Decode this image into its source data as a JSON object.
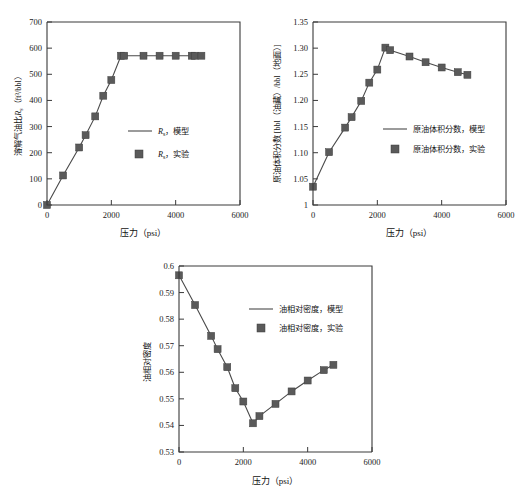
{
  "figure": {
    "background_color": "#ffffff",
    "line_color": "#4a4a4a",
    "marker_color": "#5a5a5a",
    "axis_color": "#3a3a3a"
  },
  "panels": [
    {
      "id": "rs",
      "name": "solution-gas-oil-ratio-chart"
    },
    {
      "id": "bo",
      "name": "oil-formation-volume-factor-chart"
    },
    {
      "id": "dens",
      "name": "oil-relative-density-chart"
    }
  ],
  "chart_data": [
    {
      "type": "line",
      "id": "rs",
      "title": "",
      "xlabel": "压力（psi）",
      "ylabel": "溶解气油比Rs（ft³/bbl）",
      "ylabel_main": "溶解气油比",
      "ylabel_symbol": "R",
      "ylabel_symbol_sub": "s",
      "ylabel_units": "（ft³/bbl）",
      "xlim": [
        0,
        6000
      ],
      "ylim": [
        0,
        700
      ],
      "xticks": [
        0,
        2000,
        4000,
        6000
      ],
      "xticklabels": [
        "0",
        "2000",
        "4000",
        "6000"
      ],
      "yticks": [
        0,
        100,
        200,
        300,
        400,
        500,
        600,
        700
      ],
      "yticklabels": [
        "0",
        "100",
        "200",
        "300",
        "400",
        "500",
        "600",
        "700"
      ],
      "grid": false,
      "legend_position": "center-right",
      "legend": [
        {
          "label": "Rs，模型",
          "label_prefix": "R",
          "label_sub": "s",
          "label_suffix": "，模型",
          "type": "line"
        },
        {
          "label": "Rs，实验",
          "label_prefix": "R",
          "label_sub": "s",
          "label_suffix": "，实验",
          "type": "marker"
        }
      ],
      "series": [
        {
          "name": "Rs，模型",
          "kind": "line",
          "x": [
            0,
            500,
            1000,
            1200,
            1500,
            1750,
            2000,
            2300,
            2400,
            3000,
            3500,
            4000,
            4500,
            4600,
            4800
          ],
          "y": [
            0,
            113,
            220,
            267,
            339,
            418,
            478,
            571,
            571,
            571,
            571,
            571,
            571,
            571,
            571
          ]
        },
        {
          "name": "Rs，实验",
          "kind": "marker",
          "x": [
            0,
            500,
            1000,
            1200,
            1500,
            1750,
            2000,
            2300,
            2400,
            3000,
            3500,
            4000,
            4500,
            4600,
            4800
          ],
          "y": [
            0,
            113,
            220,
            267,
            339,
            418,
            478,
            571,
            571,
            571,
            571,
            571,
            571,
            571,
            571
          ]
        }
      ]
    },
    {
      "type": "line",
      "id": "bo",
      "title": "",
      "xlabel": "压力（psi）",
      "ylabel": "原油体积分数 [bbl（油藏）/bbl（地面）]",
      "xlim": [
        0,
        6000
      ],
      "ylim": [
        1.0,
        1.35
      ],
      "xticks": [
        0,
        2000,
        4000,
        6000
      ],
      "xticklabels": [
        "0",
        "2000",
        "4000",
        "6000"
      ],
      "yticks": [
        1.0,
        1.05,
        1.1,
        1.15,
        1.2,
        1.25,
        1.3,
        1.35
      ],
      "yticklabels": [
        "1",
        "1.05",
        "1.10",
        "1.15",
        "1.20",
        "1.25",
        "1.30",
        "1.35"
      ],
      "grid": false,
      "legend_position": "center-right",
      "legend": [
        {
          "label": "原油体积分数，模型",
          "type": "line"
        },
        {
          "label": "原油体积分数，实验",
          "type": "marker"
        }
      ],
      "series": [
        {
          "name": "原油体积分数，模型",
          "kind": "line",
          "x": [
            0,
            500,
            1000,
            1200,
            1500,
            1750,
            2000,
            2250,
            2400,
            3000,
            3500,
            4000,
            4500,
            4800
          ],
          "y": [
            1.035,
            1.101,
            1.148,
            1.168,
            1.199,
            1.234,
            1.259,
            1.301,
            1.296,
            1.284,
            1.273,
            1.263,
            1.254,
            1.249
          ]
        },
        {
          "name": "原油体积分数，实验",
          "kind": "marker",
          "x": [
            0,
            500,
            1000,
            1200,
            1500,
            1750,
            2000,
            2250,
            2400,
            3000,
            3500,
            4000,
            4500,
            4800
          ],
          "y": [
            1.035,
            1.101,
            1.148,
            1.168,
            1.199,
            1.234,
            1.259,
            1.301,
            1.296,
            1.284,
            1.273,
            1.263,
            1.254,
            1.249
          ]
        }
      ]
    },
    {
      "type": "line",
      "id": "dens",
      "title": "",
      "xlabel": "压力（psi）",
      "ylabel": "油相对密度",
      "xlim": [
        0,
        6000
      ],
      "ylim": [
        0.53,
        0.6
      ],
      "xticks": [
        0,
        2000,
        4000,
        6000
      ],
      "xticklabels": [
        "0",
        "2000",
        "4000",
        "6000"
      ],
      "yticks": [
        0.53,
        0.54,
        0.55,
        0.56,
        0.57,
        0.58,
        0.59,
        0.6
      ],
      "yticklabels": [
        "0.53",
        "0.54",
        "0.55",
        "0.56",
        "0.57",
        "0.58",
        "0.59",
        "0.6"
      ],
      "grid": false,
      "legend_position": "upper-right",
      "legend": [
        {
          "label": "油相对密度，模型",
          "type": "line"
        },
        {
          "label": "油相对密度，实验",
          "type": "marker"
        }
      ],
      "series": [
        {
          "name": "油相对密度，模型",
          "kind": "line",
          "x": [
            0,
            500,
            1000,
            1200,
            1500,
            1750,
            2000,
            2300,
            2500,
            3000,
            3500,
            4000,
            4500,
            4800
          ],
          "y": [
            0.5965,
            0.5853,
            0.5737,
            0.5687,
            0.5619,
            0.554,
            0.549,
            0.5408,
            0.5435,
            0.5481,
            0.5528,
            0.5569,
            0.5608,
            0.5628
          ]
        },
        {
          "name": "油相对密度，实验",
          "kind": "marker",
          "x": [
            0,
            500,
            1000,
            1200,
            1500,
            1750,
            2000,
            2300,
            2500,
            3000,
            3500,
            4000,
            4500,
            4800
          ],
          "y": [
            0.5965,
            0.5853,
            0.5737,
            0.5687,
            0.5619,
            0.554,
            0.549,
            0.5408,
            0.5435,
            0.5481,
            0.5528,
            0.5569,
            0.5608,
            0.5628
          ]
        }
      ]
    }
  ]
}
